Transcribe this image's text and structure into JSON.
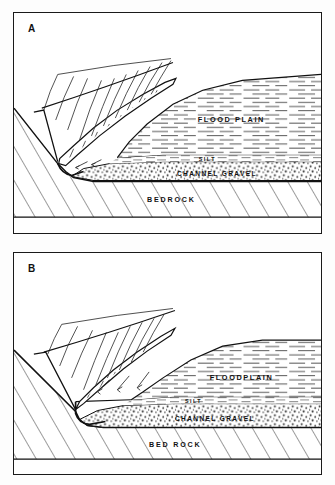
{
  "figure": {
    "type": "geological-cross-section",
    "background_color": "#ffffff",
    "ink_color": "#1a1a1a"
  },
  "panels": [
    {
      "id": "a",
      "letter": "A",
      "labels": {
        "floodplain": "FLOOD PLAIN",
        "silt": "SILT",
        "channel_gravel": "CHANNEL GRAVEL",
        "bedrock": "BEDROCK"
      }
    },
    {
      "id": "b",
      "letter": "B",
      "labels": {
        "floodplain": "FLOODPLAIN",
        "silt": "SILT",
        "channel_gravel": "CHANNEL GRAVEL",
        "bedrock": "BED ROCK"
      }
    }
  ]
}
